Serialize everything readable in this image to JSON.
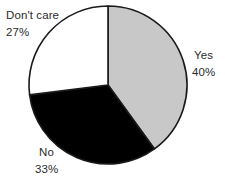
{
  "chart_data": {
    "type": "pie",
    "title": "",
    "subtitle": "",
    "xlabel": "",
    "ylabel": "",
    "grid": false,
    "legend_position": "none",
    "labels_outside": true,
    "start_angle_deg": 0,
    "direction": "clockwise",
    "center": {
      "cx": 108,
      "cy": 85,
      "r": 79
    },
    "categories": [
      "Yes",
      "No",
      "Don't care"
    ],
    "values": [
      40,
      33,
      27
    ],
    "value_unit": "%",
    "slices": [
      {
        "name": "Yes",
        "label": "Yes",
        "value": 40,
        "value_text": "40%",
        "color": "#c8c8c8",
        "outline": "#1a1a1a",
        "start_deg": 0,
        "end_deg": 144
      },
      {
        "name": "No",
        "label": "No",
        "value": 33,
        "value_text": "33%",
        "color": "#000000",
        "outline": "#1a1a1a",
        "start_deg": 144,
        "end_deg": 262.8
      },
      {
        "name": "Don't care",
        "label": "Don't care",
        "value": 27,
        "value_text": "27%",
        "color": "#ffffff",
        "outline": "#1a1a1a",
        "start_deg": 262.8,
        "end_deg": 360
      }
    ]
  },
  "labels": {
    "dontcare": {
      "name": "Don't care",
      "value": "27%"
    },
    "yes": {
      "name": "Yes",
      "value": "40%"
    },
    "no": {
      "name": "No",
      "value": "33%"
    }
  },
  "colors": {
    "background": "#ffffff",
    "outline": "#1a1a1a",
    "text": "#2b2b2b",
    "slice_yes": "#c8c8c8",
    "slice_no": "#000000",
    "slice_dontcare": "#ffffff"
  }
}
